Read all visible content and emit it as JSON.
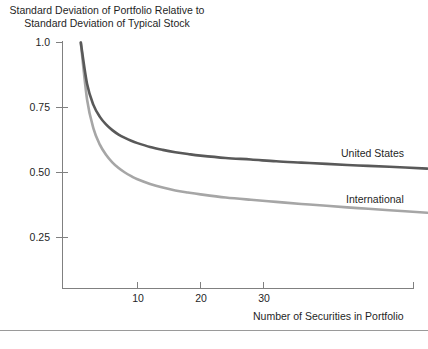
{
  "chart_data": {
    "type": "line",
    "title": "Standard Deviation of Portfolio Relative to Standard Deviation of Typical Stock",
    "title_line1": "Standard Deviation of Portfolio Relative to",
    "title_line2": "Standard Deviation of Typical Stock",
    "xlabel": "Number of Securities in Portfolio",
    "ylabel": "",
    "xlim": [
      1,
      56
    ],
    "ylim": [
      0.0,
      1.0
    ],
    "grid": false,
    "legend_position": "inline-right",
    "xticks": [
      10,
      20,
      30
    ],
    "xtick_labels": [
      "10",
      "20",
      "30"
    ],
    "yticks": [
      0.25,
      0.5,
      0.75,
      1.0
    ],
    "ytick_labels": [
      "0.25",
      "0.50",
      "0.75",
      "1.0"
    ],
    "series": [
      {
        "name": "United States",
        "color": "#595959",
        "asymptote": 0.505,
        "start": 1.0,
        "x": [
          1,
          2,
          3,
          4,
          5,
          6,
          7,
          8,
          9,
          10,
          12,
          14,
          16,
          18,
          20,
          24,
          28,
          32,
          36,
          40,
          45,
          50,
          56
        ],
        "values": [
          1.0,
          0.84,
          0.76,
          0.715,
          0.685,
          0.663,
          0.646,
          0.633,
          0.622,
          0.613,
          0.598,
          0.587,
          0.578,
          0.571,
          0.565,
          0.556,
          0.55,
          0.543,
          0.538,
          0.533,
          0.527,
          0.522,
          0.515
        ]
      },
      {
        "name": "International",
        "color": "#a6a6a6",
        "asymptote": 0.31,
        "start": 1.0,
        "x": [
          1,
          2,
          3,
          4,
          5,
          6,
          7,
          8,
          9,
          10,
          12,
          14,
          16,
          18,
          20,
          24,
          28,
          32,
          36,
          40,
          45,
          50,
          56
        ],
        "values": [
          1.0,
          0.78,
          0.67,
          0.608,
          0.568,
          0.539,
          0.517,
          0.5,
          0.486,
          0.474,
          0.456,
          0.442,
          0.431,
          0.423,
          0.416,
          0.404,
          0.395,
          0.387,
          0.379,
          0.372,
          0.363,
          0.355,
          0.345
        ]
      }
    ]
  },
  "labels": {
    "series_us": "United States",
    "series_intl": "International",
    "xaxis_title": "Number of Securities in Portfolio",
    "ytick_100": "1.0",
    "ytick_075": "0.75",
    "ytick_050": "0.50",
    "ytick_025": "0.25",
    "xtick_10": "10",
    "xtick_20": "20",
    "xtick_30": "30"
  },
  "colors": {
    "series_us": "#595959",
    "series_intl": "#a6a6a6",
    "axis": "#808080",
    "text": "#1f1f1f",
    "rule": "#9a9a9a"
  }
}
